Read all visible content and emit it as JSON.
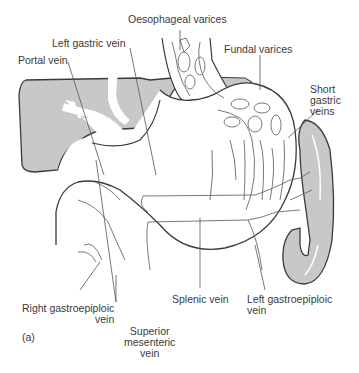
{
  "figure": {
    "panel_label": "(a)",
    "colors": {
      "organ_fill": "#c8c8c8",
      "outline": "#3a3a3a",
      "vein_line": "#6a6a6a",
      "background": "#ffffff"
    }
  },
  "labels": {
    "oesophageal_varices": "Oesophageal varices",
    "left_gastric_vein": "Left gastric vein",
    "portal_vein": "Portal vein",
    "fundal_varices": "Fundal varices",
    "short_gastric_veins": [
      "Short",
      "gastric",
      "veins"
    ],
    "right_gastroepiploic_vein": [
      "Right gastroepiploic",
      "vein"
    ],
    "superior_mesenteric_vein": [
      "Superior",
      "mesenteric",
      "vein"
    ],
    "splenic_vein": "Splenic vein",
    "left_gastroepiploic_vein": [
      "Left gastroepiploic",
      "vein"
    ]
  },
  "structures": [
    "liver",
    "stomach",
    "oesophagus",
    "spleen",
    "portal vein",
    "splenic vein"
  ]
}
